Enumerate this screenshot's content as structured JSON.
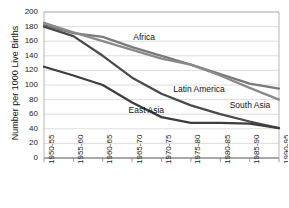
{
  "chart_data": {
    "type": "line",
    "title": "",
    "xlabel": "",
    "ylabel": "Number per 1000 Live Births",
    "ylim": [
      0,
      200
    ],
    "ytick_step": 20,
    "grid": true,
    "legend_position": "inline-annotations",
    "categories": [
      "1950-55",
      "1955-60",
      "1960-65",
      "1965-70",
      "1970-75",
      "1975-80",
      "1980-85",
      "1985-90",
      "1990-95"
    ],
    "yticks": [
      "0",
      "20",
      "40",
      "60",
      "80",
      "100",
      "120",
      "140",
      "160",
      "180",
      "200"
    ],
    "series": [
      {
        "name": "Africa",
        "color": "#7a7a7a",
        "label_x_pct": 38,
        "label_y_pct": 14,
        "values": [
          182,
          171,
          166,
          152,
          140,
          128,
          115,
          102,
          95
        ]
      },
      {
        "name": "South Asia",
        "color": "#8a8a8a",
        "label_x_pct": 79,
        "label_y_pct": 60,
        "values": [
          185,
          172,
          160,
          148,
          136,
          128,
          113,
          96,
          80
        ]
      },
      {
        "name": "Latin America",
        "color": "#4a4a4a",
        "label_x_pct": 55,
        "label_y_pct": 49,
        "values": [
          180,
          167,
          140,
          110,
          88,
          72,
          60,
          50,
          41
        ]
      },
      {
        "name": "East Asia",
        "color": "#3d3d3d",
        "label_x_pct": 36,
        "label_y_pct": 64,
        "values": [
          125,
          113,
          100,
          76,
          56,
          48,
          48,
          47,
          41
        ]
      }
    ]
  }
}
